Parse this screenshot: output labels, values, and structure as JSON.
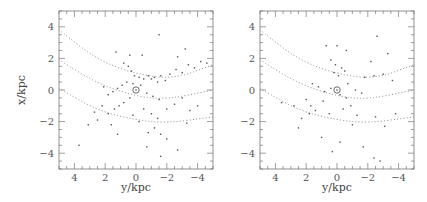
{
  "chart_data": [
    {
      "type": "scatter",
      "title": "",
      "xlabel": "y/kpc",
      "ylabel": "x/kpc",
      "xlim": [
        5,
        -5
      ],
      "ylim": [
        -5,
        5
      ],
      "x_ticks": [
        "4",
        "2",
        "0",
        "-2",
        "-4"
      ],
      "y_ticks": [
        "4",
        "2",
        "0",
        "-2",
        "-4"
      ],
      "grid": false,
      "legend": null,
      "annotations": [
        "sun symbol at (0, 0)"
      ],
      "curves": [
        {
          "name": "arm-1",
          "style": "dotted",
          "points": [
            [
              5,
              3.8
            ],
            [
              2.5,
              1.9
            ],
            [
              0,
              1.0
            ],
            [
              -2.5,
              0.7
            ],
            [
              -5,
              1.6
            ]
          ]
        },
        {
          "name": "arm-2",
          "style": "dotted",
          "points": [
            [
              5,
              1.9
            ],
            [
              2.5,
              0.4
            ],
            [
              0,
              -0.4
            ],
            [
              -2,
              -0.6
            ],
            [
              -5,
              0.0
            ]
          ]
        },
        {
          "name": "arm-3",
          "style": "dotted",
          "points": [
            [
              5,
              0.1
            ],
            [
              2.5,
              -1.3
            ],
            [
              0,
              -1.9
            ],
            [
              -2,
              -2.1
            ],
            [
              -5,
              -1.7
            ]
          ]
        }
      ],
      "points": [
        [
          0.4,
          2.2
        ],
        [
          1.3,
          2.4
        ],
        [
          -1.5,
          3.5
        ],
        [
          -3.2,
          2.6
        ],
        [
          -2.7,
          2.1
        ],
        [
          -0.4,
          2.2
        ],
        [
          0.8,
          1.7
        ],
        [
          0.5,
          1.5
        ],
        [
          0.3,
          1.2
        ],
        [
          0.1,
          0.9
        ],
        [
          -0.2,
          0.8
        ],
        [
          -0.5,
          0.7
        ],
        [
          -0.8,
          0.9
        ],
        [
          -1.0,
          0.7
        ],
        [
          -1.2,
          0.8
        ],
        [
          -1.4,
          0.5
        ],
        [
          -1.6,
          0.9
        ],
        [
          -1.9,
          0.6
        ],
        [
          -2.2,
          1.0
        ],
        [
          -2.6,
          1.3
        ],
        [
          -3.0,
          1.1
        ],
        [
          -3.4,
          1.6
        ],
        [
          -3.8,
          1.4
        ],
        [
          -4.2,
          1.8
        ],
        [
          -4.6,
          1.7
        ],
        [
          0.6,
          0.5
        ],
        [
          0.9,
          0.3
        ],
        [
          1.2,
          0.1
        ],
        [
          1.5,
          -0.1
        ],
        [
          1.8,
          -0.3
        ],
        [
          2.1,
          0.2
        ],
        [
          0.2,
          0.4
        ],
        [
          -0.3,
          0.3
        ],
        [
          -0.7,
          -0.2
        ],
        [
          -1.1,
          -0.4
        ],
        [
          -1.5,
          -0.6
        ],
        [
          0.4,
          -0.5
        ],
        [
          0.8,
          -0.8
        ],
        [
          1.1,
          -1.0
        ],
        [
          1.4,
          -1.2
        ],
        [
          1.8,
          -1.5
        ],
        [
          2.2,
          -1.0
        ],
        [
          2.7,
          -1.4
        ],
        [
          3.1,
          -2.2
        ],
        [
          -0.5,
          -1.2
        ],
        [
          -1.0,
          -1.5
        ],
        [
          -1.4,
          -1.8
        ],
        [
          -2.0,
          -1.2
        ],
        [
          -2.5,
          -0.9
        ],
        [
          -3.0,
          -0.5
        ],
        [
          -3.5,
          -1.3
        ],
        [
          -4.0,
          -1.0
        ],
        [
          -1.2,
          -2.4
        ],
        [
          -1.6,
          -2.8
        ],
        [
          -0.8,
          -2.7
        ],
        [
          1.2,
          -2.8
        ],
        [
          -0.7,
          -3.6
        ],
        [
          -1.6,
          -4.2
        ],
        [
          -2.7,
          -3.8
        ],
        [
          3.7,
          -3.5
        ],
        [
          -2.0,
          -3.1
        ],
        [
          0.2,
          -1.6
        ],
        [
          -0.2,
          -2.0
        ],
        [
          1.6,
          -2.2
        ],
        [
          2.5,
          -1.9
        ],
        [
          -3.3,
          -2.1
        ]
      ]
    },
    {
      "type": "scatter",
      "title": "",
      "xlabel": "y/kpc",
      "ylabel": "",
      "xlim": [
        5,
        -5
      ],
      "ylim": [
        -5,
        5
      ],
      "x_ticks": [
        "4",
        "2",
        "0",
        "-2",
        "-4"
      ],
      "y_ticks": [
        "4",
        "2",
        "0",
        "-2",
        "-4"
      ],
      "grid": false,
      "legend": null,
      "annotations": [
        "sun symbol at (0, 0)"
      ],
      "curves": [
        {
          "name": "arm-1",
          "style": "dotted",
          "points": [
            [
              5,
              3.8
            ],
            [
              2.5,
              1.9
            ],
            [
              0,
              1.0
            ],
            [
              -2.5,
              0.7
            ],
            [
              -5,
              1.6
            ]
          ]
        },
        {
          "name": "arm-2",
          "style": "dotted",
          "points": [
            [
              5,
              1.9
            ],
            [
              2.5,
              0.4
            ],
            [
              0,
              -0.4
            ],
            [
              -2,
              -0.6
            ],
            [
              -5,
              0.0
            ]
          ]
        },
        {
          "name": "arm-3",
          "style": "dotted",
          "points": [
            [
              5,
              0.1
            ],
            [
              2.5,
              -1.3
            ],
            [
              0,
              -1.9
            ],
            [
              -2,
              -2.1
            ],
            [
              -5,
              -1.7
            ]
          ]
        }
      ],
      "points": [
        [
          0.7,
          2.8
        ],
        [
          0.0,
          2.8
        ],
        [
          -0.6,
          2.5
        ],
        [
          0.4,
          1.9
        ],
        [
          0.1,
          1.6
        ],
        [
          -0.3,
          1.4
        ],
        [
          0.2,
          1.1
        ],
        [
          -0.1,
          0.9
        ],
        [
          -0.5,
          1.2
        ],
        [
          -2.2,
          1.8
        ],
        [
          -2.6,
          3.4
        ],
        [
          -3.3,
          2.3
        ],
        [
          -1.8,
          0.8
        ],
        [
          -2.4,
          0.9
        ],
        [
          -3.0,
          1.0
        ],
        [
          -3.6,
          0.6
        ],
        [
          1.6,
          0.4
        ],
        [
          1.2,
          0.2
        ],
        [
          0.8,
          -0.1
        ],
        [
          0.4,
          0.1
        ],
        [
          -0.2,
          -0.3
        ],
        [
          -0.6,
          -0.5
        ],
        [
          -1.2,
          0.0
        ],
        [
          -1.6,
          -0.2
        ],
        [
          2.0,
          -0.6
        ],
        [
          1.7,
          -1.0
        ],
        [
          1.4,
          -1.3
        ],
        [
          1.8,
          -1.5
        ],
        [
          2.3,
          -1.8
        ],
        [
          2.8,
          -1.0
        ],
        [
          3.6,
          -0.8
        ],
        [
          0.5,
          -1.5
        ],
        [
          -0.4,
          -1.2
        ],
        [
          -0.9,
          -1.0
        ],
        [
          -1.3,
          -1.6
        ],
        [
          -2.5,
          -1.7
        ],
        [
          -3.1,
          -2.3
        ],
        [
          1.0,
          -3.0
        ],
        [
          -0.2,
          -3.3
        ],
        [
          -1.7,
          -3.6
        ],
        [
          0.3,
          -3.9
        ],
        [
          -2.4,
          -4.3
        ],
        [
          -2.8,
          -4.5
        ],
        [
          2.5,
          -2.4
        ],
        [
          -1.0,
          -2.2
        ],
        [
          -3.8,
          -1.5
        ],
        [
          0.9,
          -0.7
        ],
        [
          -0.7,
          0.4
        ]
      ]
    }
  ]
}
